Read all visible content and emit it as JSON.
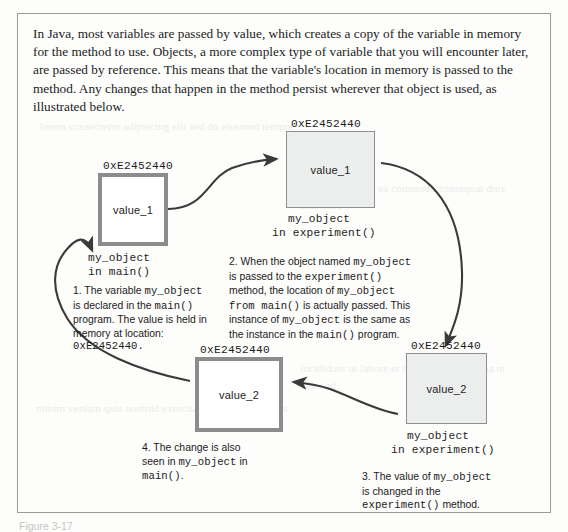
{
  "intro_paragraph": "In Java, most variables are passed by value, which creates a copy of the variable in memory for the method to use. Objects, a more complex type of variable that you will encounter later, are passed by reference. This means that the variable's location in memory is passed to the method. Any changes that happen in the method persist wherever that object is used, as illustrated below.",
  "figure_caption": "Figure 3-17",
  "colors": {
    "frame_border": "#9a9a9a",
    "thick_box_border": "#8c8c8c",
    "thin_box_border": "#8f8f8f",
    "thin_box_fill": "#eceded",
    "arrow_stroke": "#3a3a3a",
    "text": "#1b1b1b"
  },
  "boxes": [
    {
      "id": "main-value-1",
      "address": "0xE2452440",
      "value": "value_1",
      "caption_line1": "my_object",
      "caption_line2": "in main()",
      "style": "thick"
    },
    {
      "id": "experiment-value-1",
      "address": "0xE2452440",
      "value": "value_1",
      "caption_line1": "my_object",
      "caption_line2": "in experiment()",
      "style": "thin"
    },
    {
      "id": "main-value-2",
      "address": "0xE2452440",
      "value": "value_2",
      "caption_line1": "",
      "caption_line2": "",
      "style": "thick"
    },
    {
      "id": "experiment-value-2",
      "address": "0xE2452440",
      "value": "value_2",
      "caption_line1": "my_object",
      "caption_line2": "in experiment()",
      "style": "thin"
    }
  ],
  "steps": {
    "step1": {
      "l1_a": "1. The variable ",
      "l1_mono": "my_object",
      "l2_a": "is declared in the ",
      "l2_mono": "main()",
      "l3": "program. The value is held in",
      "l4": "memory at location:",
      "l5_mono": "0xE2452440."
    },
    "step2": {
      "l1_a": "2. When the object named ",
      "l1_mono": "my_object",
      "l2_a": "is passed to the ",
      "l2_mono": "experiment()",
      "l3_a": "method, the location of ",
      "l3_mono": "my_object",
      "l4_mono": "from main()",
      "l4_b": " is actually passed. This",
      "l5_a": "instance of ",
      "l5_mono": "my_object",
      "l5_b": " is the same as",
      "l6_a": "the instance in the ",
      "l6_mono": "main()",
      "l6_b": " program."
    },
    "step3": {
      "l1_a": "3. The value of ",
      "l1_mono": "my_object",
      "l2": "is changed in the",
      "l3_mono": "experiment()",
      "l3_b": " method."
    },
    "step4": {
      "l1": "4. The change is also",
      "l2_a": "seen in ",
      "l2_mono": "my_object",
      "l2_b": " in",
      "l3_mono": "main()",
      "l3_b": "."
    }
  },
  "ghost_text": {
    "g1": "lorem consectetur adipiscing elit sed do eiusmod tempor",
    "g2": "incididunt ut labore et dolore magna aliqua ut enim ad",
    "g3": "minim veniam quis nostrud exercitation ullamco laboris",
    "g4": "nisi ut aliquip ex ea commodo consequat duis aute irure"
  }
}
